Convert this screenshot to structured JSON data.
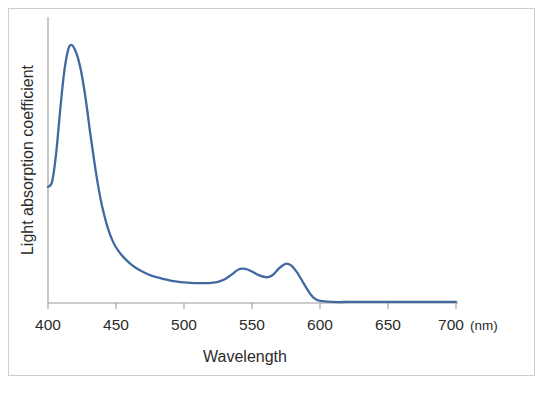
{
  "figure": {
    "background_color": "#ffffff",
    "border_color": "#cfcfcf"
  },
  "chart_data": {
    "type": "line",
    "title": "",
    "subtitle": "",
    "xlabel": "Wavelength",
    "ylabel": "Light absorption coefficient",
    "x_unit": "(nm)",
    "xlim": [
      400,
      700
    ],
    "ylim": [
      0,
      1.08
    ],
    "grid": false,
    "legend": null,
    "legend_position": "none",
    "x_ticks": [
      400,
      450,
      500,
      550,
      600,
      650,
      700
    ],
    "x_tick_labels": [
      "400",
      "450",
      "500",
      "550",
      "600",
      "650",
      "700"
    ],
    "y_ticks": [],
    "y_tick_labels": [],
    "series": [
      {
        "name": "Light absorption coefficient",
        "color": "#41699f",
        "x": [
          400,
          403,
          406,
          409,
          412,
          415,
          417,
          419,
          422,
          425,
          428,
          431,
          434,
          437,
          440,
          444,
          448,
          452,
          456,
          460,
          465,
          470,
          475,
          480,
          485,
          490,
          495,
          500,
          505,
          510,
          515,
          520,
          525,
          530,
          535,
          540,
          545,
          550,
          555,
          560,
          563,
          566,
          570,
          574,
          576,
          579,
          583,
          587,
          591,
          595,
          600,
          610,
          620,
          630,
          640,
          650,
          660,
          670,
          680,
          690,
          700
        ],
        "y": [
          0.45,
          0.47,
          0.58,
          0.75,
          0.9,
          0.985,
          1.0,
          0.99,
          0.95,
          0.88,
          0.78,
          0.66,
          0.55,
          0.45,
          0.37,
          0.29,
          0.235,
          0.2,
          0.175,
          0.155,
          0.135,
          0.12,
          0.108,
          0.1,
          0.093,
          0.087,
          0.083,
          0.08,
          0.078,
          0.077,
          0.077,
          0.078,
          0.082,
          0.092,
          0.11,
          0.13,
          0.132,
          0.122,
          0.108,
          0.1,
          0.102,
          0.112,
          0.135,
          0.15,
          0.152,
          0.145,
          0.12,
          0.085,
          0.05,
          0.022,
          0.008,
          0.004,
          0.004,
          0.004,
          0.004,
          0.004,
          0.004,
          0.004,
          0.004,
          0.004,
          0.004
        ]
      }
    ],
    "annotations": [
      {
        "name": "soret-peak",
        "x": 417,
        "y": 1.0,
        "label": ""
      },
      {
        "name": "q-band-beta-peak",
        "x": 541,
        "y": 0.132,
        "label": ""
      },
      {
        "name": "q-band-alpha-peak",
        "x": 576,
        "y": 0.152,
        "label": ""
      }
    ]
  }
}
